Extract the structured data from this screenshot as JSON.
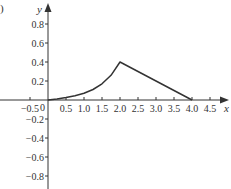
{
  "panel_label": ")",
  "chart_data": {
    "type": "line",
    "title": "",
    "xlabel": "x",
    "ylabel": "y",
    "origin_label": "0",
    "xlim": [
      -0.75,
      4.95
    ],
    "ylim": [
      -0.95,
      0.95
    ],
    "grid": false,
    "x_ticks": [
      -0.5,
      0.5,
      1.0,
      1.5,
      2.0,
      2.5,
      3.0,
      3.5,
      4.0,
      4.5
    ],
    "x_tick_labels": [
      "−0.5",
      "0.5",
      "1.0",
      "1.5",
      "2.0",
      "2.5",
      "3.0",
      "3.5",
      "4.0",
      "4.5"
    ],
    "y_ticks": [
      0.8,
      0.6,
      0.4,
      0.2,
      -0.2,
      -0.4,
      -0.6,
      -0.8
    ],
    "y_tick_labels": [
      "0.8",
      "0.6",
      "0.4",
      "0.2",
      "−0.2",
      "−0.4",
      "−0.6",
      "−0.8"
    ],
    "series": [
      {
        "name": "f(x)",
        "color": "#333333",
        "x": [
          0,
          0.25,
          0.5,
          0.75,
          1.0,
          1.25,
          1.5,
          1.75,
          2.0,
          4.0
        ],
        "y": [
          0,
          0.01,
          0.025,
          0.045,
          0.07,
          0.11,
          0.17,
          0.26,
          0.4,
          0
        ]
      }
    ]
  }
}
